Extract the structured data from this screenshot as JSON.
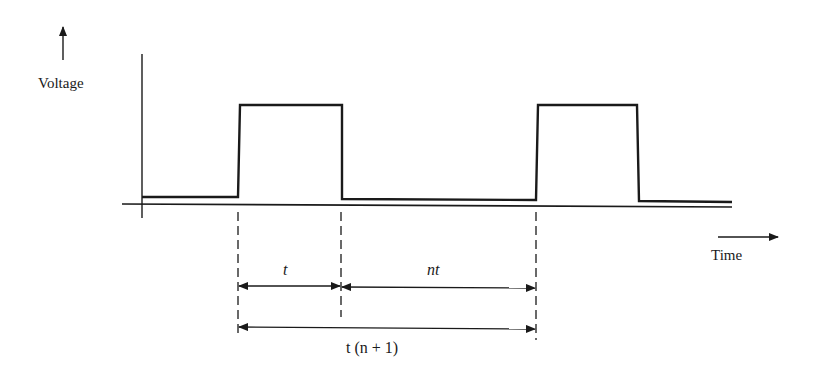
{
  "diagram": {
    "y_axis_label": "Voltage",
    "x_axis_label": "Time",
    "dimensions": {
      "pulse_width": "t",
      "off_time": "nt",
      "period": "t (n + 1)"
    },
    "pulses": 2,
    "ink_color": "#1a1a1a"
  }
}
